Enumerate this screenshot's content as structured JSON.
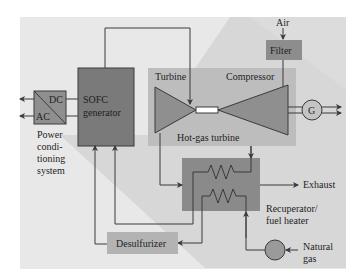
{
  "diagram": {
    "components": {
      "power_conditioning": {
        "dc": "DC",
        "ac": "AC",
        "caption_lines": [
          "Power",
          "condi-",
          "tioning",
          "system"
        ]
      },
      "sofc": {
        "lines": [
          "SOFC",
          "generator"
        ]
      },
      "turbine": "Turbine",
      "compressor": "Compressor",
      "hot_gas_turbine": "Hot-gas turbine",
      "filter": "Filter",
      "generator": "G",
      "recuperator": {
        "lines": [
          "Recuperator/",
          "fuel heater"
        ]
      },
      "desulfurizer": "Desulfurizer",
      "natural_gas": {
        "lines": [
          "Natural",
          "gas"
        ]
      }
    },
    "streams": {
      "air": "Air",
      "exhaust": "Exhaust"
    },
    "colors": {
      "background": "#e6e6e6",
      "band": "#d2d2d2",
      "sofc_box": "#7a7a7a",
      "component": "#8f8f8f",
      "turbine_panel": "#bcbcbc",
      "filter": "#8d8d8d",
      "desulfurizer": "#b3b3b3",
      "line": "#3a3a3a"
    }
  }
}
